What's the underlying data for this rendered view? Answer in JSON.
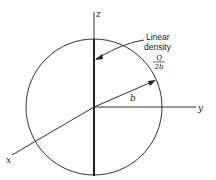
{
  "diagram": {
    "axes": {
      "z": "z",
      "y": "y",
      "x": "x"
    },
    "radius_label": "b",
    "annotation": {
      "line1": "Linear",
      "line2": "density",
      "numerator": "Q",
      "denominator": "2b"
    }
  }
}
